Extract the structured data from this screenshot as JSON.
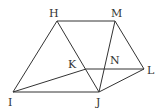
{
  "diagram": {
    "points": {
      "H": {
        "label": "H",
        "x": 57,
        "y": 21
      },
      "M": {
        "label": "M",
        "x": 115,
        "y": 21
      },
      "I": {
        "label": "I",
        "x": 13,
        "y": 92
      },
      "J": {
        "label": "J",
        "x": 99,
        "y": 92
      },
      "L": {
        "label": "L",
        "x": 144,
        "y": 69
      },
      "K": {
        "label": "K",
        "x": 86,
        "y": 69
      },
      "N": {
        "label": "N",
        "x": 104,
        "y": 69
      }
    },
    "segments": [
      "HM",
      "HI",
      "HJ",
      "MJ",
      "ML",
      "IJ",
      "JL",
      "IK",
      "KL"
    ],
    "stroke_color": "#333333",
    "background": "#ffffff"
  }
}
